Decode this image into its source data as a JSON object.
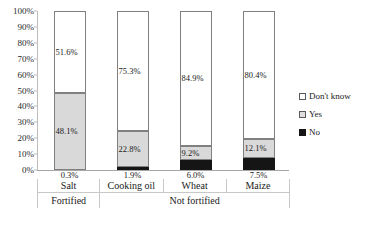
{
  "chart_data": {
    "type": "bar",
    "subtype": "stacked-100-percent",
    "title": "",
    "xlabel": "",
    "ylabel": "",
    "ylim": [
      0,
      100
    ],
    "y_tick_labels": [
      "100%",
      "90%",
      "80%",
      "70%",
      "60%",
      "50%",
      "40%",
      "30%",
      "20%",
      "10%",
      "0%"
    ],
    "y_tick_values": [
      100,
      90,
      80,
      70,
      60,
      50,
      40,
      30,
      20,
      10,
      0
    ],
    "grid": false,
    "legend_position": "right",
    "categories": [
      "Salt",
      "Cooking oil",
      "Wheat",
      "Maize"
    ],
    "groups": [
      {
        "label": "Fortified",
        "categories": [
          "Salt"
        ]
      },
      {
        "label": "Not fortified",
        "categories": [
          "Cooking oil",
          "Wheat",
          "Maize"
        ]
      }
    ],
    "series": [
      {
        "name": "No",
        "color": "#151515",
        "values": [
          0.3,
          1.9,
          6.0,
          7.5
        ],
        "value_labels": [
          "0.3%",
          "1.9%",
          "6.0%",
          "7.5%"
        ],
        "label_position": "outside-below"
      },
      {
        "name": "Yes",
        "color": "#d9d9d9",
        "values": [
          48.1,
          22.8,
          9.2,
          12.1
        ],
        "value_labels": [
          "48.1%",
          "22.8%",
          "9.2%",
          "12.1%"
        ],
        "label_position": "inside"
      },
      {
        "name": "Don't know",
        "color": "#ffffff",
        "values": [
          51.6,
          75.3,
          84.9,
          80.4
        ],
        "value_labels": [
          "51.6%",
          "75.3%",
          "84.9%",
          "80.4%"
        ],
        "label_position": "inside"
      }
    ],
    "stack_order_bottom_to_top": [
      "No",
      "Yes",
      "Don't know"
    ]
  },
  "legend": {
    "items": [
      {
        "label": "Don't know",
        "swatch": "white-square"
      },
      {
        "label": "Yes",
        "swatch": "gray-square"
      },
      {
        "label": "No",
        "swatch": "black-square"
      }
    ]
  },
  "colors": {
    "dont_know": "#ffffff",
    "yes": "#d9d9d9",
    "no": "#151515",
    "axis": "#bdbdbd",
    "border": "#808080"
  }
}
